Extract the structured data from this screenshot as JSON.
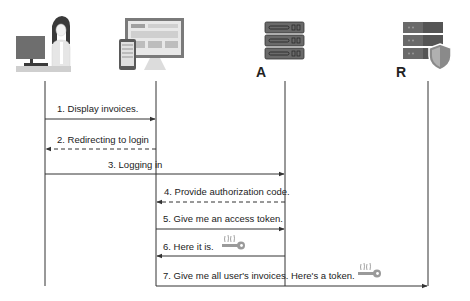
{
  "diagram": {
    "type": "sequence",
    "actors": [
      {
        "id": "user",
        "label": "",
        "icon": "user-at-computer-icon",
        "x": 45
      },
      {
        "id": "client",
        "label": "",
        "icon": "web-app-devices-icon",
        "x": 156
      },
      {
        "id": "auth_server",
        "label": "A",
        "icon": "server-rack-icon",
        "x": 285
      },
      {
        "id": "resource_server",
        "label": "R",
        "icon": "secure-server-shield-icon",
        "x": 428
      }
    ],
    "messages": [
      {
        "n": 1,
        "text": "1. Display invoices.",
        "from": "user",
        "to": "client",
        "style": "solid"
      },
      {
        "n": 2,
        "text": "2. Redirecting to login",
        "from": "client",
        "to": "user",
        "style": "dashed"
      },
      {
        "n": 3,
        "text": "3. Logging in",
        "from": "user",
        "to": "auth_server",
        "style": "solid"
      },
      {
        "n": 4,
        "text": "4. Provide authorization code.",
        "from": "auth_server",
        "to": "client",
        "style": "dashed"
      },
      {
        "n": 5,
        "text": "5. Give me an access token.",
        "from": "client",
        "to": "auth_server",
        "style": "solid"
      },
      {
        "n": 6,
        "text": "6. Here it is.",
        "from": "auth_server",
        "to": "client",
        "style": "solid",
        "icon": "key-token-icon"
      },
      {
        "n": 7,
        "text": "7. Give me all user's invoices. Here's a token.",
        "from": "client",
        "to": "resource_server",
        "style": "solid",
        "icon": "key-token-icon"
      }
    ],
    "colors": {
      "line": "#333333",
      "icon_gray": "#7a7a7a",
      "icon_dark": "#555555",
      "key": "#9a9a9a"
    }
  }
}
